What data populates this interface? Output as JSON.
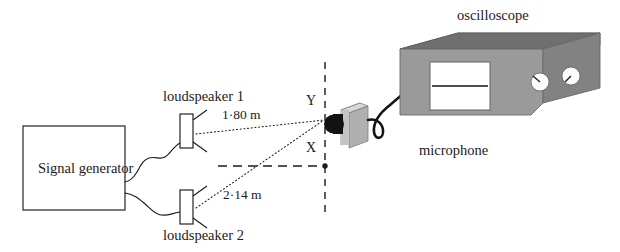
{
  "diagram": {
    "labels": {
      "signal_generator": "Signal generator",
      "loudspeaker1": "loudspeaker 1",
      "loudspeaker2": "loudspeaker 2",
      "oscilloscope": "oscilloscope",
      "microphone": "microphone",
      "point_y": "Y",
      "point_x": "X",
      "distance1": "1·80 m",
      "distance2": "2·14 m"
    },
    "measurements": [
      {
        "from": "loudspeaker 1",
        "to": "Y",
        "value": "1·80 m"
      },
      {
        "from": "loudspeaker 2",
        "to": "Y",
        "value": "2·14 m"
      }
    ],
    "points": [
      {
        "name": "Y",
        "description": "microphone position on vertical line"
      },
      {
        "name": "X",
        "description": "point on central axis"
      }
    ],
    "colors": {
      "ink": "#1b1b1b",
      "oscilloscope_front": "#9a9a9a",
      "oscilloscope_top": "#6f6f6f",
      "oscilloscope_side": "#828282",
      "screen": "#ffffff",
      "knob": "#fbfbfb",
      "microphone_body": "#b4b4b4",
      "microphone_top": "#cfcfcf",
      "microphone_head": "#111111",
      "cable": "#141414",
      "background": "#ffffff"
    },
    "icons": {
      "speaker": "loudspeaker-icon",
      "scope": "oscilloscope-icon",
      "mic": "microphone-icon"
    }
  }
}
